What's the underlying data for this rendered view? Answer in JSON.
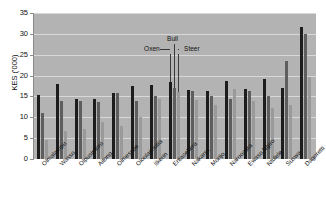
{
  "chart_data": {
    "type": "bar",
    "title": "",
    "subtitle": "",
    "xlabel": "",
    "ylabel": "KES ('000)",
    "ylim": [
      0,
      35
    ],
    "yticks": [
      0,
      5,
      10,
      15,
      20,
      25,
      30,
      35
    ],
    "ytick_labels": [
      "0",
      "5",
      "10",
      "15",
      "20",
      "25",
      "30",
      "35"
    ],
    "grid": true,
    "legend_position": "annotated-inline",
    "categories": [
      "Olmalampu",
      "Wasso",
      "Olpusimoro",
      "Aitong",
      "Olmesutie",
      "Oloolaimutia",
      "Ilkerin",
      "Entasekera",
      "Nakarra",
      "Morijo",
      "Naroosura",
      "Ewaso Ngiro",
      "Ntulele",
      "Suswa",
      "Dagoretti"
    ],
    "series": [
      {
        "name": "Oxen",
        "color": "#1c1c1c",
        "values": [
          15.3,
          17.9,
          14.3,
          14.4,
          15.8,
          17.5,
          17.8,
          18.5,
          16.5,
          16.4,
          18.7,
          16.8,
          19.1,
          17.0,
          31.7
        ]
      },
      {
        "name": "Bull",
        "color": "#5e5e5e",
        "values": [
          11.0,
          13.8,
          14.0,
          13.6,
          15.8,
          13.8,
          15.2,
          17.0,
          16.4,
          15.2,
          14.4,
          16.4,
          15.2,
          23.5,
          30.0
        ]
      },
      {
        "name": "Steer",
        "color": "#9a9a9a",
        "values": [
          4.6,
          6.6,
          7.1,
          8.8,
          8.0,
          10.1,
          14.3,
          16.0,
          14.2,
          13.0,
          16.8,
          14.0,
          12.3,
          13.0,
          19.7
        ]
      }
    ],
    "annotations": [
      {
        "text": "Oxen",
        "target_series": "Oxen"
      },
      {
        "text": "Bull",
        "target_series": "Bull"
      },
      {
        "text": "Steer",
        "target_series": "Steer"
      }
    ]
  }
}
